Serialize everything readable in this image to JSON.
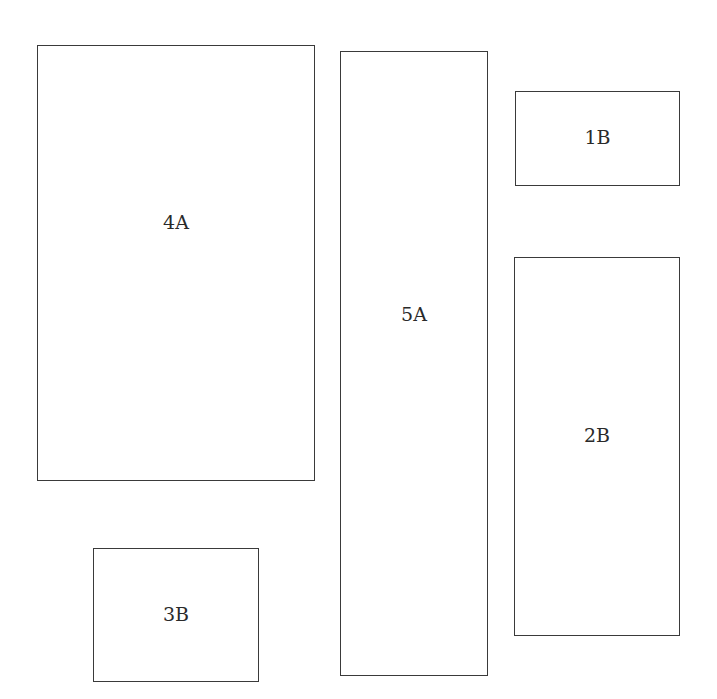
{
  "diagram": {
    "type": "block-layout",
    "boxes": [
      {
        "id": "4A",
        "label": "4A",
        "x": 37,
        "y": 45,
        "w": 278,
        "h": 436
      },
      {
        "id": "5A",
        "label": "5A",
        "x": 340,
        "y": 51,
        "w": 148,
        "h": 625
      },
      {
        "id": "1B",
        "label": "1B",
        "x": 515,
        "y": 91,
        "w": 165,
        "h": 95
      },
      {
        "id": "2B",
        "label": "2B",
        "x": 514,
        "y": 257,
        "w": 166,
        "h": 379
      },
      {
        "id": "3B",
        "label": "3B",
        "x": 93,
        "y": 548,
        "w": 166,
        "h": 134
      }
    ]
  }
}
